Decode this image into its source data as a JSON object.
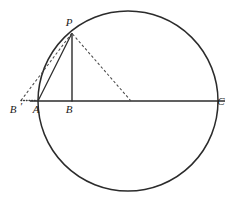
{
  "figure": {
    "canvas": {
      "width": 237,
      "height": 202,
      "background": "#ffffff"
    },
    "stroke_color": "#2b2b2b",
    "label_color": "#1a1a1a",
    "labels": {
      "p": "P",
      "b_prime": "B",
      "b_prime_mark": "′",
      "a": "A",
      "b": "B",
      "c": "C"
    },
    "label_positions": {
      "p": {
        "x": 69,
        "y": 26
      },
      "b_prime": {
        "x": 13,
        "y": 113
      },
      "b_prime_mark": {
        "x": 21,
        "y": 113
      },
      "a": {
        "x": 36,
        "y": 113
      },
      "b": {
        "x": 69,
        "y": 113
      },
      "c": {
        "x": 221,
        "y": 105
      }
    },
    "circle": {
      "cx": 128,
      "cy": 101,
      "r": 90,
      "stroke_width": 1.5
    },
    "points": {
      "P": {
        "x": 72,
        "y": 33
      },
      "A": {
        "x": 38,
        "y": 101
      },
      "B": {
        "x": 72,
        "y": 101
      },
      "C": {
        "x": 218,
        "y": 101
      },
      "B_prime": {
        "x": 21,
        "y": 101
      },
      "D": {
        "x": 131,
        "y": 101
      },
      "T": {
        "x": 54,
        "y": 56
      }
    },
    "segments": [
      {
        "name": "diameter-ac",
        "style": "solid",
        "x1": 30,
        "y1": 101,
        "x2": 225,
        "y2": 101,
        "width": 1.6
      },
      {
        "name": "altitude-pb",
        "style": "solid",
        "x1": 72,
        "y1": 33,
        "x2": 72,
        "y2": 101,
        "width": 1.4
      },
      {
        "name": "chord-pa",
        "style": "solid",
        "x1": 72,
        "y1": 33,
        "x2": 38,
        "y2": 101,
        "width": 1.4
      },
      {
        "name": "dashed-p-to-d",
        "style": "dashed",
        "x1": 72,
        "y1": 33,
        "x2": 131,
        "y2": 101,
        "width": 1.1
      },
      {
        "name": "dashed-bprime-to-p",
        "style": "dashed",
        "x1": 21,
        "y1": 101,
        "x2": 72,
        "y2": 33,
        "width": 1.1
      },
      {
        "name": "dotted-bprime-to-a",
        "style": "dotted",
        "x1": 21,
        "y1": 101,
        "x2": 39,
        "y2": 101,
        "width": 1.4
      }
    ]
  }
}
